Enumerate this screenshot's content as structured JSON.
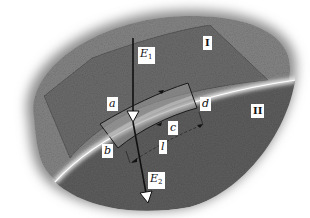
{
  "figure": {
    "regions": {
      "upper": "I",
      "lower": "II"
    },
    "vectors": {
      "upper": {
        "symbol": "E",
        "subscript": "1"
      },
      "lower": {
        "symbol": "E",
        "subscript": "2"
      }
    },
    "contour_corners": [
      "a",
      "b",
      "c",
      "d"
    ],
    "length_label": "l",
    "colors": {
      "background": "#ffffff",
      "medium": "#7a7a7a",
      "medium_dark": "#5a5a5a",
      "boundary": "#e8e8e8",
      "lines": "#111111"
    }
  }
}
